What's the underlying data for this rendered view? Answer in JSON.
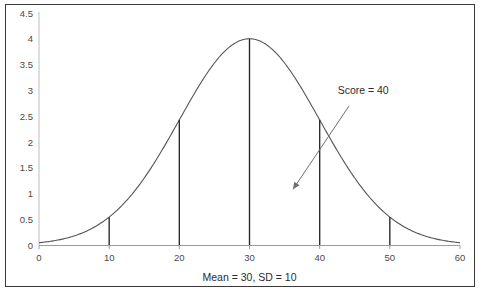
{
  "chart_data": {
    "type": "line",
    "title": "",
    "subtitle": "",
    "xlabel": "Mean = 30, SD = 10",
    "ylabel": "",
    "xlim": [
      0,
      60
    ],
    "ylim": [
      0,
      4.5
    ],
    "grid": false,
    "legend": "none",
    "distribution": {
      "name": "normal",
      "mean": 30,
      "sd": 10,
      "peak_value": 4.0,
      "note": "bell curve scaled so density at mean equals 4.0"
    },
    "x_ticks": [
      "0",
      "10",
      "20",
      "30",
      "40",
      "50",
      "60"
    ],
    "x_tick_values": [
      0,
      10,
      20,
      30,
      40,
      50,
      60
    ],
    "y_ticks": [
      "0",
      "0.5",
      "1",
      "1.5",
      "2",
      "2.5",
      "3",
      "3.5",
      "4",
      "4.5"
    ],
    "y_tick_values": [
      0,
      0.5,
      1,
      1.5,
      2,
      2.5,
      3,
      3.5,
      4,
      4.5
    ],
    "series": [
      {
        "name": "normal-curve",
        "type": "line",
        "color": "#555555",
        "x": [
          0,
          2,
          4,
          6,
          8,
          10,
          12,
          14,
          16,
          18,
          20,
          22,
          24,
          26,
          28,
          30,
          32,
          34,
          36,
          38,
          40,
          42,
          44,
          46,
          48,
          50,
          52,
          54,
          56,
          58,
          60
        ],
        "values": [
          0.044,
          0.077,
          0.13,
          0.209,
          0.324,
          0.485,
          0.698,
          0.968,
          1.293,
          1.662,
          2.055,
          2.445,
          2.8,
          3.086,
          3.275,
          3.342,
          3.275,
          3.086,
          2.8,
          2.445,
          2.055,
          1.662,
          1.293,
          0.968,
          0.698,
          0.485,
          0.324,
          0.209,
          0.13,
          0.077,
          0.044
        ]
      }
    ],
    "drop_lines": [
      {
        "name": "sd-line-minus-2",
        "x": 10,
        "y": 0.54
      },
      {
        "name": "sd-line-minus-1",
        "x": 20,
        "y": 2.43
      },
      {
        "name": "mean-line",
        "x": 30,
        "y": 4.0
      },
      {
        "name": "sd-line-plus-1",
        "x": 40,
        "y": 2.43
      },
      {
        "name": "sd-line-plus-2",
        "x": 50,
        "y": 0.54
      }
    ],
    "annotations": [
      {
        "name": "score-annotation",
        "text": "Score = 40",
        "text_x": 46.2,
        "text_y": 2.93,
        "arrow_from_x": 44.2,
        "arrow_from_y": 2.7,
        "arrow_to_x": 36.2,
        "arrow_to_y": 1.08
      }
    ],
    "colors": {
      "curve": "#555555",
      "drop_line": "#2b2b2b",
      "axis": "#9a9a9a",
      "border": "#3a3a3a",
      "tick_text": "#4a4a4a",
      "annotation": "#2b2b2b",
      "background": "#ffffff"
    }
  }
}
